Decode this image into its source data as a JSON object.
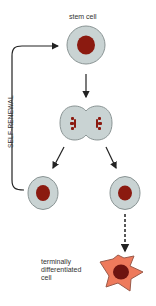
{
  "diagram": {
    "labels": {
      "stem_cell": "stem cell",
      "self_renewal": "SELF-RENEWAL",
      "terminal_line1": "terminally",
      "terminal_line2": "differentiated",
      "terminal_line3": "cell"
    },
    "colors": {
      "cell_fill": "#c9d3d3",
      "cell_stroke": "#8a9494",
      "nucleus": "#8b1a10",
      "diff_cell_fill": "#ee7a5c",
      "diff_cell_stroke": "#9a5a4a",
      "diff_nucleus": "#6e1410",
      "arrow": "#222222"
    },
    "nodes": [
      {
        "id": "stem-cell",
        "type": "cell"
      },
      {
        "id": "dividing-cell",
        "type": "mitosis"
      },
      {
        "id": "daughter-left",
        "type": "cell"
      },
      {
        "id": "daughter-right",
        "type": "cell"
      },
      {
        "id": "terminal-cell",
        "type": "differentiated"
      }
    ],
    "edges": [
      {
        "from": "stem-cell",
        "to": "dividing-cell",
        "style": "solid"
      },
      {
        "from": "dividing-cell",
        "to": "daughter-left",
        "style": "solid"
      },
      {
        "from": "dividing-cell",
        "to": "daughter-right",
        "style": "solid"
      },
      {
        "from": "daughter-left",
        "to": "stem-cell",
        "style": "solid",
        "label": "SELF-RENEWAL"
      },
      {
        "from": "daughter-right",
        "to": "terminal-cell",
        "style": "dashed"
      }
    ]
  }
}
